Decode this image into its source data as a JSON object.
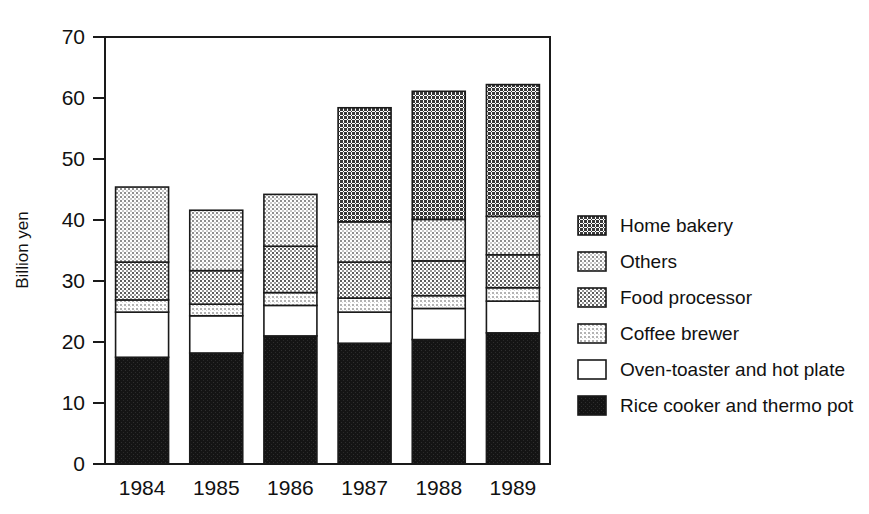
{
  "chart_data": {
    "type": "bar",
    "subtype": "stacked-vertical",
    "title": "",
    "xlabel": "",
    "ylabel": "Billion yen",
    "ylim": [
      0,
      70
    ],
    "yticks": [
      0,
      10,
      20,
      30,
      40,
      50,
      60,
      70
    ],
    "ytick_labels": [
      "0",
      "10",
      "20",
      "30",
      "40",
      "50",
      "60",
      "70"
    ],
    "grid": false,
    "legend_position": "right",
    "categories": [
      "1984",
      "1985",
      "1986",
      "1987",
      "1988",
      "1989"
    ],
    "series": [
      {
        "name": "Rice cooker and thermo pot",
        "swatch": "solid-black",
        "color": "#1a1a1a",
        "values": [
          17.5,
          18.2,
          21.0,
          19.8,
          20.4,
          21.5
        ]
      },
      {
        "name": "Oven-toaster and hot plate",
        "swatch": "white",
        "color": "#ffffff",
        "values": [
          7.4,
          6.1,
          5.0,
          5.1,
          5.1,
          5.2
        ]
      },
      {
        "name": "Coffee brewer",
        "swatch": "light-checker",
        "color": "#cccccc",
        "values": [
          2.0,
          1.9,
          2.1,
          2.3,
          2.1,
          2.2
        ]
      },
      {
        "name": "Food processor",
        "swatch": "medium-checker",
        "color": "#a0a0a0",
        "values": [
          6.2,
          5.5,
          7.6,
          5.9,
          5.7,
          5.4
        ]
      },
      {
        "name": "Others",
        "swatch": "pale-checker",
        "color": "#d9d9d9",
        "values": [
          12.3,
          9.9,
          8.5,
          6.6,
          6.8,
          6.3
        ]
      },
      {
        "name": "Home bakery",
        "swatch": "dark-checker",
        "color": "#6b6b6b",
        "values": [
          0.0,
          0.0,
          0.0,
          18.7,
          21.0,
          21.6
        ]
      }
    ],
    "totals": [
      45.4,
      41.6,
      44.2,
      58.4,
      61.1,
      62.2
    ]
  },
  "axes": {
    "y_title": "Billion yen"
  },
  "legend": {
    "entries": [
      {
        "label": "Home bakery",
        "swatch": "dark-checker"
      },
      {
        "label": "Others",
        "swatch": "pale-checker"
      },
      {
        "label": "Food processor",
        "swatch": "medium-checker"
      },
      {
        "label": "Coffee brewer",
        "swatch": "light-checker"
      },
      {
        "label": "Oven-toaster and hot plate",
        "swatch": "white"
      },
      {
        "label": "Rice cooker and thermo pot",
        "swatch": "solid-black"
      }
    ]
  }
}
